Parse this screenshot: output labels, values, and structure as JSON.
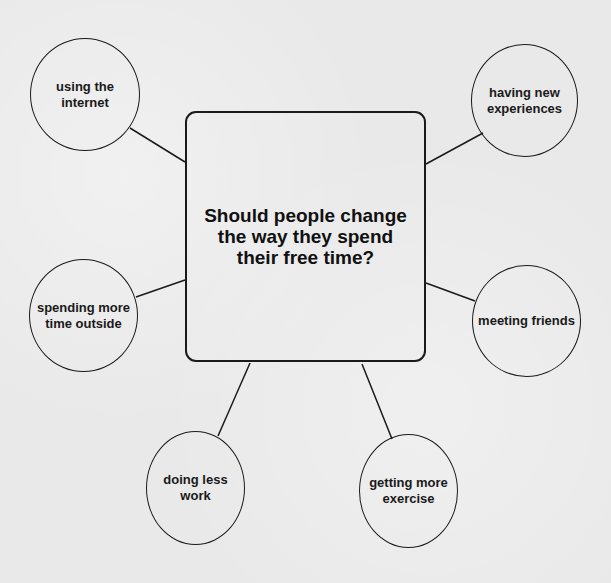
{
  "diagram": {
    "type": "mind-map",
    "central": {
      "text": "Should people change the way they spend their free time?"
    },
    "nodes": [
      {
        "id": "n1",
        "text": "using the internet"
      },
      {
        "id": "n2",
        "text": "having new experiences"
      },
      {
        "id": "n3",
        "text": "spending more time outside"
      },
      {
        "id": "n4",
        "text": "meeting friends"
      },
      {
        "id": "n5",
        "text": "doing less work"
      },
      {
        "id": "n6",
        "text": "getting more exercise"
      }
    ],
    "edges": [
      {
        "from": "central",
        "to": "n1"
      },
      {
        "from": "central",
        "to": "n2"
      },
      {
        "from": "central",
        "to": "n3"
      },
      {
        "from": "central",
        "to": "n4"
      },
      {
        "from": "central",
        "to": "n5"
      },
      {
        "from": "central",
        "to": "n6"
      }
    ],
    "colors": {
      "stroke": "#1a1a1a",
      "background": "#e9e9e9",
      "text": "#111111"
    }
  }
}
